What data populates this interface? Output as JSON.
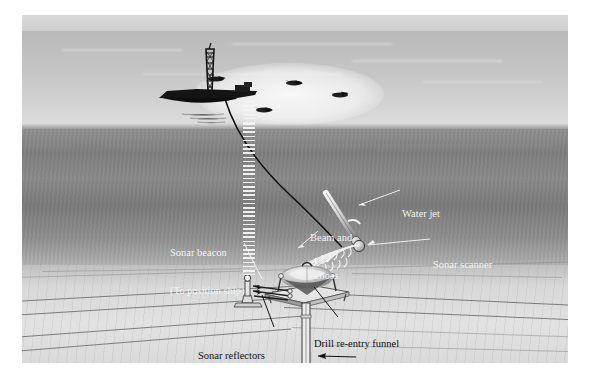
{
  "figure": {
    "medium": "airbrush / halftone technical illustration",
    "palette": {
      "sky": "#c4c4c4",
      "sea_surface": "#b8b8b8",
      "upper_water": "#8f8f8f",
      "mid_water": "#7a7a7a",
      "lower_water": "#a6a6a6",
      "seafloor": "#dcdcdc",
      "ink": "#111111",
      "light_label": "#f2f2f2",
      "equipment": "#1a1a1a"
    }
  },
  "labels": [
    {
      "id": "sonar-beacon",
      "line1": "Sonar beacon",
      "line2": "(To position ship)",
      "tone": "light",
      "x": 148,
      "y": 207
    },
    {
      "id": "beam-and-echoes",
      "line1": "Beam and",
      "line2": "echoes",
      "tone": "light",
      "x": 288,
      "y": 198
    },
    {
      "id": "water-jet",
      "line1": "Water jet",
      "line2": "",
      "tone": "light",
      "x": 380,
      "y": 175
    },
    {
      "id": "sonar-scanner",
      "line1": "Sonar scanner",
      "line2": "",
      "tone": "light",
      "x": 411,
      "y": 226
    },
    {
      "id": "sonar-reflectors",
      "line1": "Sonar reflectors",
      "line2": "",
      "tone": "dark",
      "x": 190,
      "y": 317
    },
    {
      "id": "drill-re-entry-funnel",
      "line1": "Drill re-entry funnel",
      "line2": "",
      "tone": "dark",
      "x": 313,
      "y": 307
    },
    {
      "id": "drill-casing",
      "line1": "Drill casing",
      "line2": "",
      "tone": "dark",
      "x": 336,
      "y": 344
    }
  ],
  "scene": {
    "ship": {
      "name": "drill ship",
      "derrick": "drilling derrick",
      "thruster_count": 4
    },
    "seafloor_equipment": [
      "sonar beacon post",
      "sonar reflector frame",
      "drill re-entry funnel",
      "drill casing"
    ],
    "acoustic": {
      "beacon_column": "vertical acoustic pulse column rising to ship",
      "scanner_fan": "sonar beam and echo fan from scanner to reflectors"
    }
  }
}
